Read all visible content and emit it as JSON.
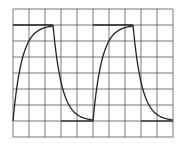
{
  "diagram": {
    "type": "oscilloscope-waveform",
    "grid": {
      "columns": 10,
      "rows": 8
    },
    "colors": {
      "grid": "#555555",
      "trace": "#222222",
      "background": "#ffffff"
    },
    "waveform": {
      "periods": 2,
      "high_level_division": 1,
      "low_level_division": 7,
      "cycle_divisions": 5,
      "rise_divisions": 2.5,
      "fall_divisions": 2.5
    }
  }
}
